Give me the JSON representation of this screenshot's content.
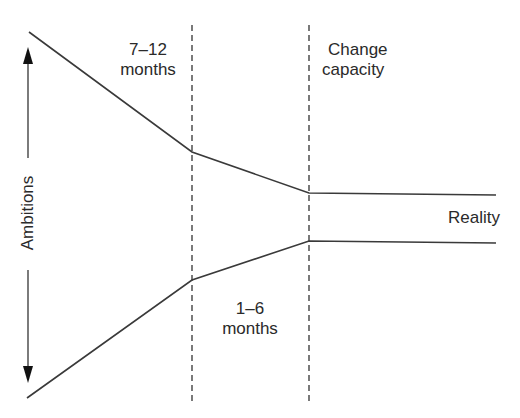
{
  "diagram": {
    "axis_label": "Ambitions",
    "labels": {
      "top_left": {
        "line1": "7–12",
        "line2": "months"
      },
      "top_right": {
        "line1": "Change",
        "line2": "capacity"
      },
      "bottom_mid": {
        "line1": "1–6",
        "line2": "months"
      },
      "right": "Reality"
    },
    "colors": {
      "line": "#3a3a3a",
      "background": "#ffffff"
    }
  }
}
